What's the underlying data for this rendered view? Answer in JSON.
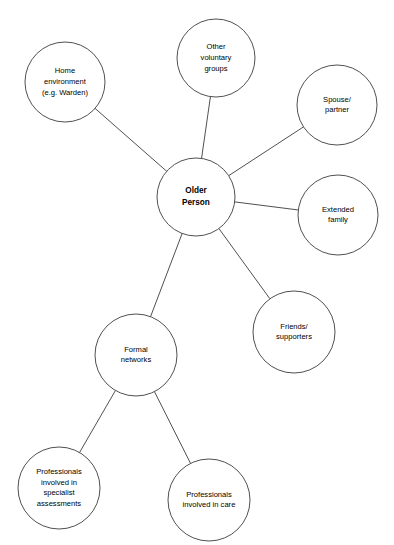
{
  "diagram": {
    "type": "hub-and-spoke-network",
    "canvas": {
      "width": 394,
      "height": 545
    },
    "style": {
      "background": "#ffffff",
      "node_fill": "#ffffff",
      "node_stroke": "#3c3c3c",
      "edge_stroke": "#3c3c3c",
      "text_color": "#000000"
    },
    "nodes": [
      {
        "id": "older-person",
        "name": "older-person",
        "lines": [
          "Older",
          "Person"
        ],
        "cx": 196,
        "cy": 197,
        "r": 39,
        "bold": true
      },
      {
        "id": "home-environment",
        "name": "home-environment",
        "lines": [
          "Home",
          "environment",
          "(e.g. Warden)"
        ],
        "cx": 65,
        "cy": 82,
        "r": 40,
        "bold": false
      },
      {
        "id": "other-voluntary-groups",
        "name": "other-voluntary-groups",
        "lines": [
          "Other",
          "voluntary",
          "groups"
        ],
        "cx": 216,
        "cy": 58,
        "r": 39,
        "bold": false
      },
      {
        "id": "spouse-partner",
        "name": "spouse-partner",
        "lines": [
          "Spouse/",
          "partner"
        ],
        "cx": 337,
        "cy": 105,
        "r": 40,
        "bold": false
      },
      {
        "id": "extended-family",
        "name": "extended-family",
        "lines": [
          "Extended",
          "family"
        ],
        "cx": 338,
        "cy": 215,
        "r": 40,
        "bold": false
      },
      {
        "id": "friends-supporters",
        "name": "friends-supporters",
        "lines": [
          "Friends/",
          "supporters"
        ],
        "cx": 294,
        "cy": 332,
        "r": 41,
        "bold": false
      },
      {
        "id": "formal-networks",
        "name": "formal-networks",
        "lines": [
          "Formal",
          "networks"
        ],
        "cx": 136,
        "cy": 355,
        "r": 41,
        "bold": false
      },
      {
        "id": "professionals-specialist-assessments",
        "name": "professionals-specialist-assessments",
        "lines": [
          "Professionals",
          "involved in",
          "specialist",
          "assessments"
        ],
        "cx": 59,
        "cy": 488,
        "r": 41,
        "bold": false
      },
      {
        "id": "professionals-involved-in-care",
        "name": "professionals-involved-in-care",
        "lines": [
          "Professionals",
          "involved in care"
        ],
        "cx": 209,
        "cy": 500,
        "r": 41,
        "bold": false
      }
    ],
    "edges": [
      {
        "id": "edge-older-person-home-environment",
        "from": "older-person",
        "to": "home-environment"
      },
      {
        "id": "edge-older-person-other-voluntary-groups",
        "from": "older-person",
        "to": "other-voluntary-groups"
      },
      {
        "id": "edge-older-person-spouse-partner",
        "from": "older-person",
        "to": "spouse-partner"
      },
      {
        "id": "edge-older-person-extended-family",
        "from": "older-person",
        "to": "extended-family"
      },
      {
        "id": "edge-older-person-friends-supporters",
        "from": "older-person",
        "to": "friends-supporters"
      },
      {
        "id": "edge-older-person-formal-networks",
        "from": "older-person",
        "to": "formal-networks"
      },
      {
        "id": "edge-formal-networks-professionals-specialist-assessments",
        "from": "formal-networks",
        "to": "professionals-specialist-assessments"
      },
      {
        "id": "edge-formal-networks-professionals-involved-in-care",
        "from": "formal-networks",
        "to": "professionals-involved-in-care"
      }
    ]
  }
}
